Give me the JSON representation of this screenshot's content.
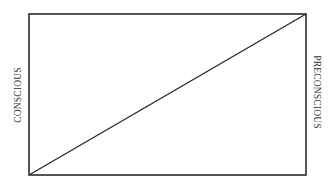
{
  "diagram": {
    "labels": {
      "left": "CONSCIOUS",
      "right": "PRECONSCIOUS"
    },
    "stroke_color": "#2a2a2a",
    "rectangle": {
      "x": 29,
      "y": 14,
      "width": 277,
      "height": 161
    },
    "diagonal": {
      "from": "bottom-left",
      "to": "top-right"
    }
  }
}
